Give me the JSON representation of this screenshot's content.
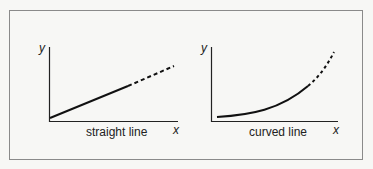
{
  "diagram": {
    "panels": [
      {
        "caption": "straight line",
        "x_axis_label": "x",
        "y_axis_label": "y",
        "curve_type": "linear",
        "solid_segment": "measured",
        "dashed_segment": "extrapolated"
      },
      {
        "caption": "curved line",
        "x_axis_label": "x",
        "y_axis_label": "y",
        "curve_type": "exponential",
        "solid_segment": "measured",
        "dashed_segment": "extrapolated"
      }
    ],
    "colors": {
      "line": "#111111",
      "axis": "#222222",
      "border": "#8a8a8a",
      "background": "#f7f7f5"
    }
  }
}
